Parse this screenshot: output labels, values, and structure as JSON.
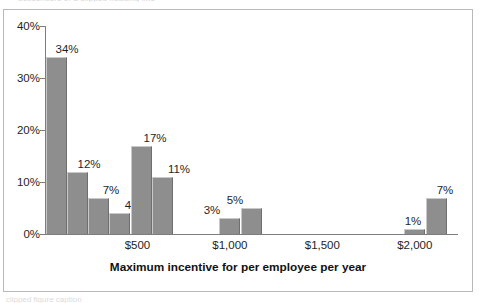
{
  "figure": {
    "top_clipped_text": "descenders of a clipped heading line",
    "bottom_clipped_text": "clipped figure caption",
    "frame_color": "#b9b9b9",
    "bar_color": "#8e8e8e",
    "axis_color": "#7d7d7d"
  },
  "chart_data": {
    "type": "bar",
    "title": "",
    "xlabel": "Maximum incentive for per employee per year",
    "ylabel": "",
    "ylim": [
      0,
      40
    ],
    "yticks": [
      0,
      10,
      20,
      30,
      40
    ],
    "ytick_labels": [
      "0%",
      "10%",
      "20%",
      "30%",
      "40%"
    ],
    "xlim": [
      0,
      2250
    ],
    "xticks": [
      500,
      1000,
      1500,
      2000
    ],
    "xtick_labels": [
      "$500",
      "$1,000",
      "$1,500",
      "$2,000"
    ],
    "grid": false,
    "legend": null,
    "value_suffix": "%",
    "bars": [
      {
        "x_center": 60,
        "value": 34,
        "label": "34%",
        "label_x": 63,
        "label_dy": 14
      },
      {
        "x_center": 175,
        "value": 12,
        "label": "12%",
        "label_x": 85,
        "label_dy": 14
      },
      {
        "x_center": 290,
        "value": 7,
        "label": "7%",
        "label_x": 107,
        "label_dy": 14
      },
      {
        "x_center": 405,
        "value": 4,
        "label": "4%",
        "label_x": 129,
        "label_dy": 14
      },
      {
        "x_center": 520,
        "value": 17,
        "label": "17%",
        "label_x": 151,
        "label_dy": 14
      },
      {
        "x_center": 635,
        "value": 11,
        "label": "11%",
        "label_x": 175,
        "label_dy": 14
      },
      {
        "x_center": 1000,
        "value": 3,
        "label": "3%",
        "label_x": 208,
        "label_dy": 14
      },
      {
        "x_center": 1115,
        "value": 5,
        "label": "5%",
        "label_x": 231,
        "label_dy": 14
      },
      {
        "x_center": 2000,
        "value": 1,
        "label": "1%",
        "label_x": 409,
        "label_dy": 14
      },
      {
        "x_center": 2115,
        "value": 7,
        "label": "7%",
        "label_x": 441,
        "label_dy": 14
      }
    ]
  }
}
